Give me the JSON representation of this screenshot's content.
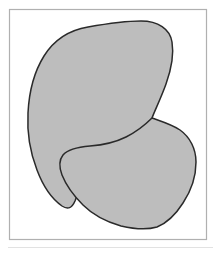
{
  "figure": {
    "caption": "",
    "background_color": "#ffffff",
    "width": 221,
    "height": 253
  },
  "frame": {
    "name": "figure-border",
    "stroke_color": "#b0b0b0",
    "stroke_width": 1.2,
    "fill_color": "#ffffff",
    "x": 9.5,
    "y": 9.5,
    "width": 197,
    "height": 230
  },
  "separator": {
    "name": "bottom-rule",
    "stroke_color": "#e2e2e2",
    "stroke_width": 1,
    "x1": 8,
    "y1": 247.5,
    "x2": 213,
    "y2": 247.5
  },
  "style": {
    "shape_fill": "#bdbdbd",
    "shape_stroke": "#2a2a2a",
    "shape_stroke_width": 1.5
  },
  "shapes": [
    {
      "id": "upper-blob",
      "label": "Upper region",
      "fill": "#bdbdbd",
      "stroke": "#2a2a2a",
      "stroke_width": 1.5,
      "bounds": {
        "left": 28,
        "top": 21,
        "right": 173,
        "bottom": 210
      },
      "path": "M 141 21 C 158 21 170 29 172 42 C 174 54 171 70 166 84 C 161 98 155 110 152 118 C 146 131 138 140 126 148 C 112 157 99 163 90 172 C 84 178 79 190 75 201 C 72 208 68 210 62 206 C 52 199 43 186 37 170 C 30 152 27 131 28 113 C 29 93 34 72 44 56 C 54 40 70 30 88 27 C 105 24 124 21 141 21 Z"
    },
    {
      "id": "lower-blob",
      "label": "Lower region",
      "fill": "#bdbdbd",
      "stroke": "#2a2a2a",
      "stroke_width": 1.5,
      "bounds": {
        "left": 59,
        "top": 118,
        "right": 196,
        "bottom": 229
      },
      "path": "M 152 118 C 160 121 171 124 180 130 C 190 137 196 149 196 162 C 196 176 191 191 183 203 C 176 214 167 223 157 227 C 147 230 134 229 121 226 C 107 222 93 215 83 205 C 74 196 66 185 62 175 C 59 167 59 160 63 155 C 68 149 78 147 90 146 C 103 145 116 142 126 137 C 136 132 145 125 152 118 Z"
    }
  ],
  "junction": {
    "name": "cusp-point",
    "description": "Point where the upper and lower region outlines meet",
    "x": 152,
    "y": 118
  }
}
